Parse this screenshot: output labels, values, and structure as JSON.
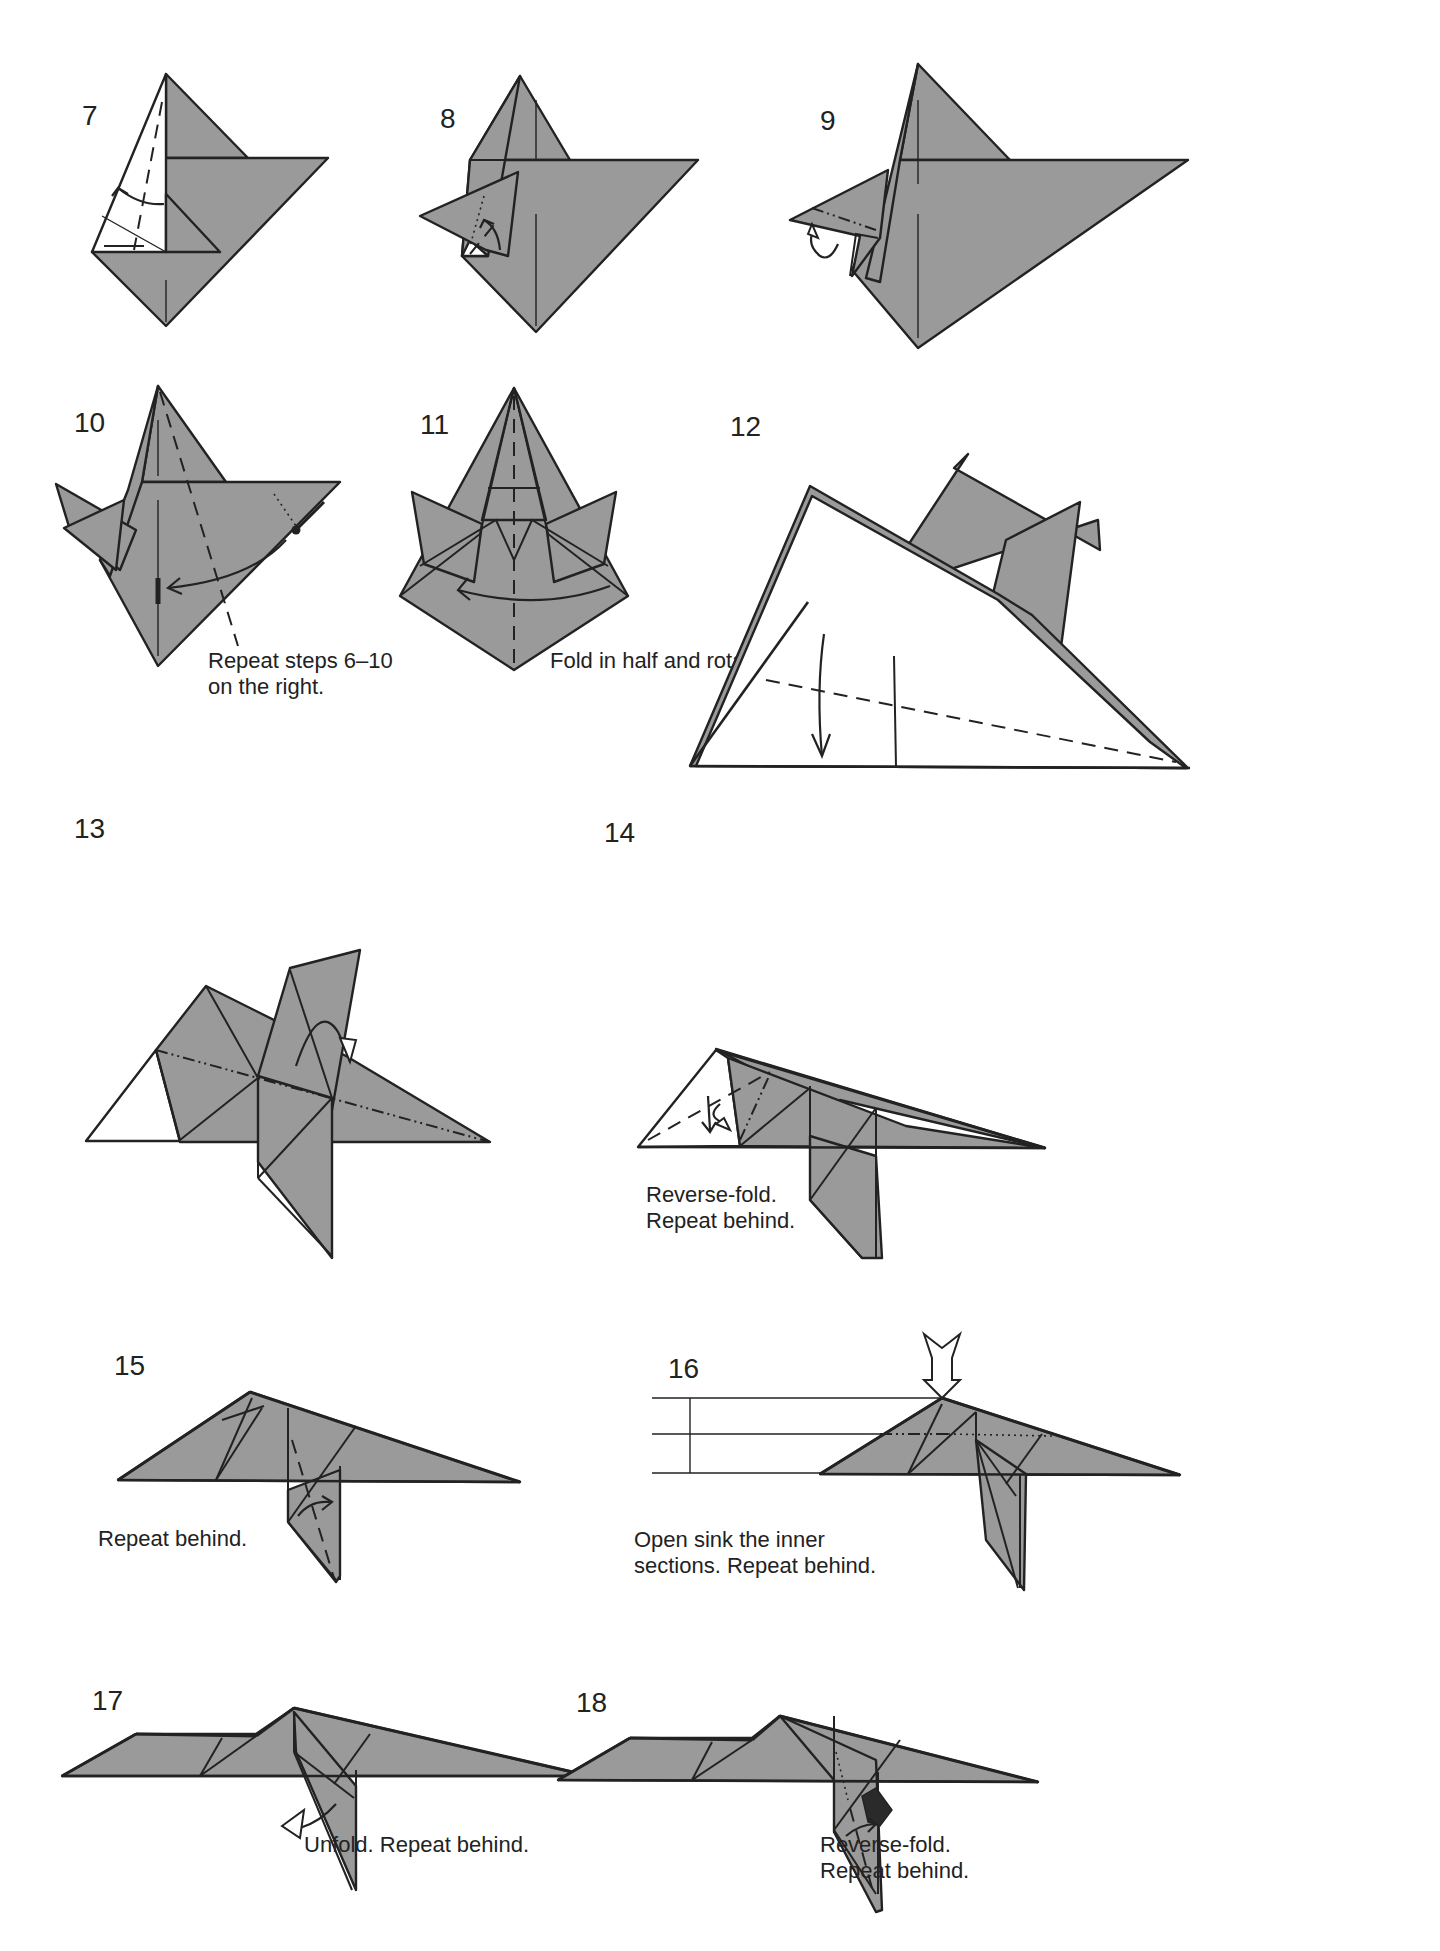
{
  "page": {
    "paper_color": "#9a9a9a",
    "line_color": "#222222",
    "background": "#ffffff"
  },
  "legend": {
    "valley_fold": "dashed line",
    "mountain_fold": "dash-dot line",
    "x_ray_line": "dotted line",
    "fold_arrow": "curved arrow",
    "push_arrow": "hollow arrow (sink)"
  },
  "steps": [
    {
      "number": "7",
      "label_pos": [
        82,
        125
      ],
      "caption": []
    },
    {
      "number": "8",
      "label_pos": [
        440,
        128
      ],
      "caption": []
    },
    {
      "number": "9",
      "label_pos": [
        820,
        130
      ],
      "caption": []
    },
    {
      "number": "10",
      "label_pos": [
        74,
        432
      ],
      "caption": [
        "Repeat steps 6–10",
        "on the right."
      ],
      "caption_pos": [
        208,
        668
      ]
    },
    {
      "number": "11",
      "label_pos": [
        420,
        434
      ],
      "caption": [
        "Fold in half and rotate."
      ],
      "caption_pos": [
        550,
        668
      ]
    },
    {
      "number": "12",
      "label_pos": [
        730,
        436
      ],
      "caption": []
    },
    {
      "number": "13",
      "label_pos": [
        74,
        838
      ],
      "caption": []
    },
    {
      "number": "14",
      "label_pos": [
        604,
        842
      ],
      "caption": [
        "Reverse-fold.",
        "Repeat behind."
      ],
      "caption_pos": [
        646,
        1202
      ]
    },
    {
      "number": "15",
      "label_pos": [
        114,
        1375
      ],
      "caption": [
        "Repeat behind."
      ],
      "caption_pos": [
        98,
        1546
      ]
    },
    {
      "number": "16",
      "label_pos": [
        668,
        1378
      ],
      "caption": [
        "Open sink the inner",
        "sections. Repeat behind."
      ],
      "caption_pos": [
        634,
        1547
      ]
    },
    {
      "number": "17",
      "label_pos": [
        92,
        1710
      ],
      "caption": [
        "Unfold. Repeat behind."
      ],
      "caption_pos": [
        304,
        1852
      ]
    },
    {
      "number": "18",
      "label_pos": [
        576,
        1712
      ],
      "caption": [
        "Reverse-fold.",
        "Repeat behind."
      ],
      "caption_pos": [
        820,
        1852
      ]
    }
  ]
}
